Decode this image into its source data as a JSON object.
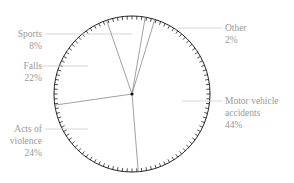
{
  "chart_data": {
    "type": "pie",
    "title": "",
    "categories": [
      "Motor vehicle accidents",
      "Acts of violence",
      "Falls",
      "Sports",
      "Other"
    ],
    "values": [
      44,
      24,
      22,
      8,
      2
    ],
    "units": "%",
    "start_angle_deg_clockwise_from_top": 17,
    "direction": "clockwise",
    "style": {
      "fill": "none",
      "outline_color": "#222222",
      "tick_marks": true,
      "divider_color": "#888888",
      "leader_color": "#cccccc",
      "label_color": "#9a9a9a"
    }
  },
  "labels": {
    "sports": {
      "name": "Sports",
      "pct": "8%"
    },
    "falls": {
      "name": "Falls",
      "pct": "22%"
    },
    "other": {
      "name": "Other",
      "pct": "2%"
    },
    "violence": {
      "line1": "Acts of",
      "line2": "violence",
      "pct": "24%"
    },
    "motor": {
      "line1": "Motor vehicle",
      "line2": "accidents",
      "pct": "44%"
    }
  }
}
